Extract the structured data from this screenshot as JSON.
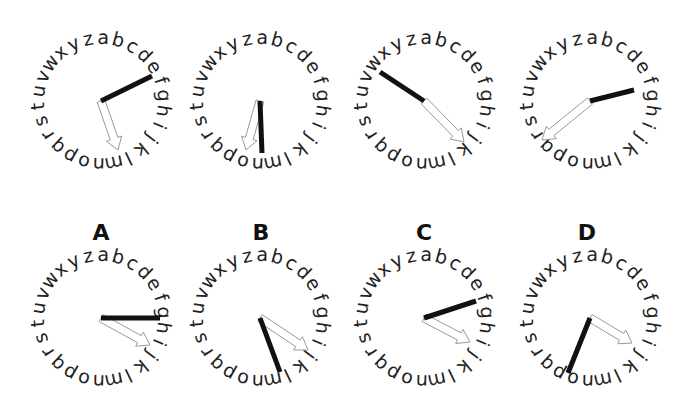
{
  "figure": {
    "alphabet": [
      "a",
      "b",
      "c",
      "d",
      "e",
      "f",
      "g",
      "h",
      "i",
      "j",
      "k",
      "l",
      "m",
      "n",
      "o",
      "p",
      "q",
      "r",
      "s",
      "t",
      "u",
      "v",
      "w",
      "x",
      "y",
      "z"
    ],
    "colors": {
      "hand": "#111111",
      "arrow_stroke": "#9a9a9a",
      "arrow_fill": "#ffffff",
      "letters": "#222222",
      "background": "#ffffff"
    },
    "radius": 64,
    "letter_offset_deg": 2,
    "top_row": [
      {
        "id": "example-1",
        "cx": 101,
        "cy": 101,
        "hand_end": [
          152,
          76
        ],
        "arrow_end": [
          118,
          150
        ]
      },
      {
        "id": "example-2",
        "cx": 260,
        "cy": 101,
        "hand_end": [
          262,
          153
        ],
        "arrow_end": [
          246,
          150
        ]
      },
      {
        "id": "example-3",
        "cx": 424,
        "cy": 101,
        "hand_end": [
          380,
          72
        ],
        "arrow_end": [
          464,
          142
        ]
      },
      {
        "id": "example-4",
        "cx": 590,
        "cy": 101,
        "hand_end": [
          634,
          90
        ],
        "arrow_end": [
          542,
          140
        ]
      }
    ],
    "bottom_row": [
      {
        "id": "option-a",
        "label": "A",
        "cx": 101,
        "cy": 318,
        "hand_end": [
          160,
          318
        ],
        "arrow_end": [
          150,
          345
        ]
      },
      {
        "id": "option-b",
        "label": "B",
        "cx": 260,
        "cy": 318,
        "hand_end": [
          280,
          372
        ],
        "arrow_end": [
          308,
          350
        ]
      },
      {
        "id": "option-c",
        "label": "C",
        "cx": 424,
        "cy": 318,
        "hand_end": [
          476,
          301
        ],
        "arrow_end": [
          470,
          342
        ]
      },
      {
        "id": "option-d",
        "label": "D",
        "cx": 590,
        "cy": 318,
        "hand_end": [
          568,
          373
        ],
        "arrow_end": [
          632,
          343
        ]
      }
    ],
    "labels": {
      "a": "A",
      "b": "B",
      "c": "C",
      "d": "D"
    }
  }
}
